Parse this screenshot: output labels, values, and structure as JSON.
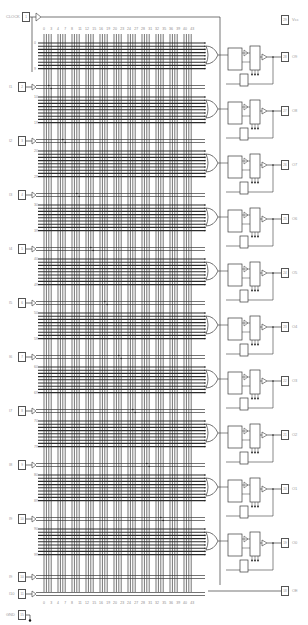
{
  "diagram": {
    "title": "",
    "clock": {
      "label": "CLOCK",
      "pin": "1"
    },
    "vcc": {
      "label": "Vcc",
      "pin": "29"
    },
    "gnd": {
      "label": "GND",
      "pin": "15"
    },
    "top_column_labels": [
      "0",
      "3",
      "4",
      "7",
      "8",
      "11",
      "12",
      "15",
      "16",
      "19",
      "20",
      "23",
      "24",
      "27",
      "28",
      "31",
      "32",
      "35",
      "36",
      "39",
      "40",
      "43"
    ],
    "bottom_column_labels": [
      "0",
      "3",
      "4",
      "7",
      "8",
      "11",
      "12",
      "15",
      "16",
      "19",
      "20",
      "23",
      "24",
      "27",
      "28",
      "31",
      "32",
      "35",
      "36",
      "39",
      "40",
      "43"
    ],
    "inputs": [
      {
        "label": "I1",
        "pin": "2"
      },
      {
        "label": "I2",
        "pin": "3"
      },
      {
        "label": "I3",
        "pin": "4"
      },
      {
        "label": "I4",
        "pin": "5"
      },
      {
        "label": "I5",
        "pin": "6"
      },
      {
        "label": "I6",
        "pin": "7"
      },
      {
        "label": "I7",
        "pin": "8"
      },
      {
        "label": "I8",
        "pin": "9"
      },
      {
        "label": "I9",
        "pin": "10"
      },
      {
        "label": "I10",
        "pin": "11"
      }
    ],
    "outputs": [
      {
        "label": "O9",
        "pin": "28"
      },
      {
        "label": "O8",
        "pin": "27"
      },
      {
        "label": "O7",
        "pin": "26"
      },
      {
        "label": "O6",
        "pin": "25"
      },
      {
        "label": "O5",
        "pin": "24"
      },
      {
        "label": "O4",
        "pin": "23"
      },
      {
        "label": "O3",
        "pin": "22"
      },
      {
        "label": "O2",
        "pin": "21"
      },
      {
        "label": "O1",
        "pin": "20"
      },
      {
        "label": "O0",
        "pin": "19"
      },
      {
        "label": "OE",
        "pin": "18"
      }
    ],
    "row_labels": [
      "0",
      "9",
      "10",
      "19",
      "20",
      "29",
      "30",
      "39",
      "40",
      "49",
      "50",
      "59",
      "60",
      "69",
      "70",
      "79",
      "80",
      "89",
      "90",
      "99",
      "100",
      "109",
      "110",
      "119",
      "120",
      "129",
      "130",
      "131"
    ],
    "colors": {
      "line": "#3a3a3a",
      "bus": "#1e1e1e",
      "label": "#9a9a9a",
      "background": "#ffffff"
    }
  }
}
